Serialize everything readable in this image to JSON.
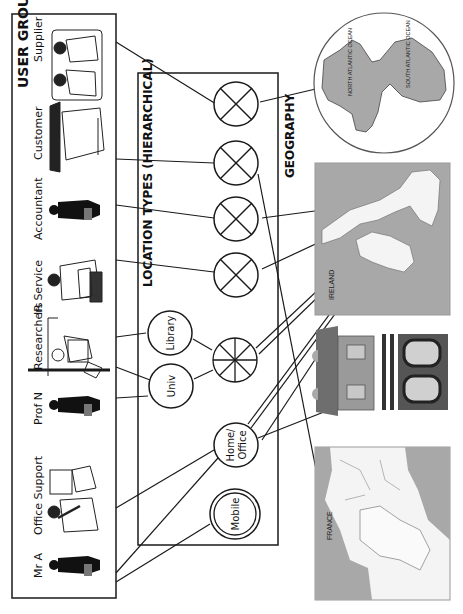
{
  "orientation": "rotated-90-clockwise",
  "panels": {
    "user_groups": {
      "title": "USER GROUPS"
    },
    "location_types": {
      "title": "LOCATION TYPES (HIERARCHICAL)"
    },
    "geography": {
      "title": "GEOGRAPHY"
    }
  },
  "user_groups": [
    {
      "id": "supplier",
      "label": "Supplier"
    },
    {
      "id": "customer",
      "label": "Customer"
    },
    {
      "id": "accountant",
      "label": "Accountant"
    },
    {
      "id": "ir-service",
      "label": "IR Service"
    },
    {
      "id": "researchers",
      "label": "Researchers"
    },
    {
      "id": "prof-n",
      "label": "Prof N"
    },
    {
      "id": "office-support",
      "label": "Office Support"
    },
    {
      "id": "mr-a",
      "label": "Mr A"
    }
  ],
  "location_nodes": [
    {
      "id": "loc-x1",
      "label": "",
      "symbol": "cross-circle"
    },
    {
      "id": "loc-x2",
      "label": "",
      "symbol": "cross-circle"
    },
    {
      "id": "loc-x3",
      "label": "",
      "symbol": "cross-circle"
    },
    {
      "id": "loc-x4",
      "label": "",
      "symbol": "cross-circle"
    },
    {
      "id": "library",
      "label": "Library",
      "symbol": "circle"
    },
    {
      "id": "univ",
      "label": "Univ",
      "symbol": "circle"
    },
    {
      "id": "hub",
      "label": "",
      "symbol": "wheel-circle"
    },
    {
      "id": "home-office",
      "label_line1": "Home/",
      "label_line2": "Office",
      "symbol": "circle"
    },
    {
      "id": "mobile",
      "label": "Mobile",
      "symbol": "double-circle"
    }
  ],
  "geography": {
    "globe": {
      "labels": [
        "NORTH ATLANTIC OCEAN",
        "SOUTH ATLANTIC OCEAN"
      ]
    },
    "map_ireland": {
      "label": "IRELAND"
    },
    "building": {
      "label": ""
    },
    "map_france": {
      "label": "FRANCE"
    }
  },
  "colors": {
    "line": "#1a1a1a",
    "ocean": "#a8a8a8",
    "land": "#f4f4f4",
    "building": "#6e6e6e",
    "background": "#ffffff"
  }
}
